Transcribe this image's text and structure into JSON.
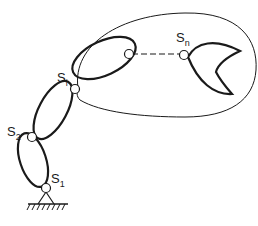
{
  "diagram": {
    "type": "serial manipulator chain with workspace envelope",
    "joints": [
      {
        "id": "s1",
        "label": "S",
        "sub": "1"
      },
      {
        "id": "s2",
        "label": "S",
        "sub": "2"
      },
      {
        "id": "si",
        "label": "S",
        "sub": "i"
      },
      {
        "id": "sn",
        "label": "S",
        "sub": "n"
      }
    ],
    "links": [
      "link-1",
      "link-2",
      "link-i",
      "end-effector-gripper"
    ],
    "base": "fixed ground",
    "caption": "(caption cut off, unreadable)"
  },
  "colors": {
    "stroke": "#1a1a1a",
    "background": "#ffffff"
  }
}
